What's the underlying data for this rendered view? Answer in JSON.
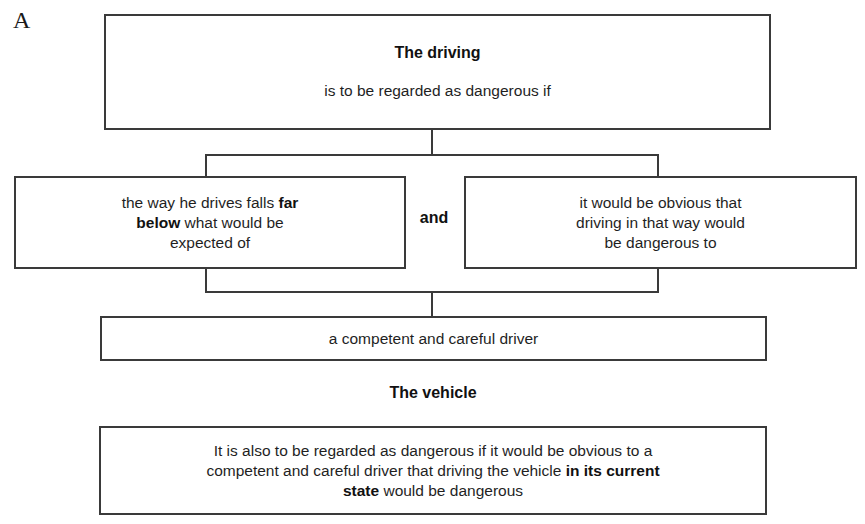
{
  "panel_label": "A",
  "top_box": {
    "title": "The driving",
    "subtitle": "is to be regarded as dangerous if"
  },
  "left_box": {
    "parts": [
      {
        "text": "the way he drives falls ",
        "bold": false
      },
      {
        "text": "far below",
        "bold": true
      },
      {
        "text": " what would be expected of",
        "bold": false
      }
    ],
    "line1_a": "the way he drives falls ",
    "line1_b": "far",
    "line2_a": "below",
    "line2_b": " what would be",
    "line3": "expected of"
  },
  "connector_label": "and",
  "right_box": {
    "line1": "it would be obvious that",
    "line2": "driving in that way would",
    "line3": "be dangerous to"
  },
  "shared_box": {
    "text": "a competent and careful driver"
  },
  "vehicle_section": {
    "heading": "The vehicle",
    "line1": "It is also to be regarded as dangerous if it would be obvious to a",
    "line2_a": "competent and careful driver that driving the vehicle ",
    "line2_b": "in its current",
    "line3_a": "state",
    "line3_b": " would be dangerous"
  },
  "colors": {
    "border": "#3a3a3a",
    "text": "#1f1f1f",
    "background": "#ffffff"
  }
}
